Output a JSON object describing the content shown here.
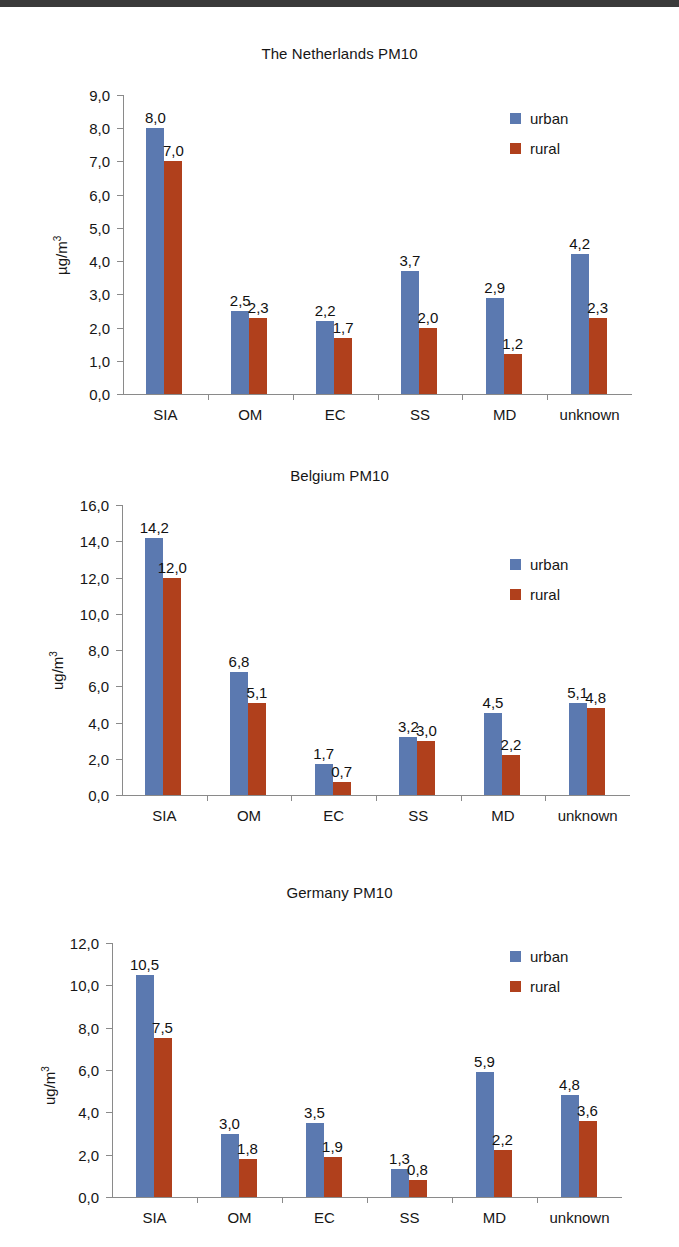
{
  "page": {
    "background": "#ffffff",
    "series_colors": {
      "urban": "#5b79b0",
      "rural": "#b0401c"
    },
    "axis_color": "#8a8a8a"
  },
  "legend": {
    "urban_label": "urban",
    "rural_label": "rural"
  },
  "chart_data": [
    {
      "id": "netherlands",
      "type": "bar",
      "title": "The Netherlands PM10",
      "xlabel": "",
      "ylabel": "µg/m3",
      "ylabel_base": "µg/m",
      "ylabel_sup": "3",
      "categories": [
        "SIA",
        "OM",
        "EC",
        "SS",
        "MD",
        "unknown"
      ],
      "ylim": [
        0,
        9
      ],
      "ytick_step": 1,
      "ytick_labels": [
        "0,0",
        "1,0",
        "2,0",
        "3,0",
        "4,0",
        "5,0",
        "6,0",
        "7,0",
        "8,0",
        "9,0"
      ],
      "grid": false,
      "legend_position": "top-right",
      "series": [
        {
          "name": "urban",
          "values": [
            8.0,
            2.5,
            2.2,
            3.7,
            2.9,
            4.2
          ],
          "labels": [
            "8,0",
            "2,5",
            "2,2",
            "3,7",
            "2,9",
            "4,2"
          ]
        },
        {
          "name": "rural",
          "values": [
            7.0,
            2.3,
            1.7,
            2.0,
            1.2,
            2.3
          ],
          "labels": [
            "7,0",
            "2,3",
            "1,7",
            "2,0",
            "1,2",
            "2,3"
          ]
        }
      ]
    },
    {
      "id": "belgium",
      "type": "bar",
      "title": "Belgium PM10",
      "xlabel": "",
      "ylabel": "ug/m3",
      "ylabel_base": "ug/m",
      "ylabel_sup": "3",
      "categories": [
        "SIA",
        "OM",
        "EC",
        "SS",
        "MD",
        "unknown"
      ],
      "ylim": [
        0,
        16
      ],
      "ytick_step": 2,
      "ytick_labels": [
        "0,0",
        "2,0",
        "4,0",
        "6,0",
        "8,0",
        "10,0",
        "12,0",
        "14,0",
        "16,0"
      ],
      "grid": false,
      "legend_position": "top-right",
      "series": [
        {
          "name": "urban",
          "values": [
            14.2,
            6.8,
            1.7,
            3.2,
            4.5,
            5.1
          ],
          "labels": [
            "14,2",
            "6,8",
            "1,7",
            "3,2",
            "4,5",
            "5,1"
          ]
        },
        {
          "name": "rural",
          "values": [
            12.0,
            5.1,
            0.7,
            3.0,
            2.2,
            4.8
          ],
          "labels": [
            "12,0",
            "5,1",
            "0,7",
            "3,0",
            "2,2",
            "4,8"
          ]
        }
      ]
    },
    {
      "id": "germany",
      "type": "bar",
      "title": "Germany  PM10",
      "xlabel": "",
      "ylabel": "ug/m3",
      "ylabel_base": "ug/m",
      "ylabel_sup": "3",
      "categories": [
        "SIA",
        "OM",
        "EC",
        "SS",
        "MD",
        "unknown"
      ],
      "ylim": [
        0,
        12
      ],
      "ytick_step": 2,
      "ytick_labels": [
        "0,0",
        "2,0",
        "4,0",
        "6,0",
        "8,0",
        "10,0",
        "12,0"
      ],
      "grid": false,
      "legend_position": "top-right",
      "series": [
        {
          "name": "urban",
          "values": [
            10.5,
            3.0,
            3.5,
            1.3,
            5.9,
            4.8
          ],
          "labels": [
            "10,5",
            "3,0",
            "3,5",
            "1,3",
            "5,9",
            "4,8"
          ]
        },
        {
          "name": "rural",
          "values": [
            7.5,
            1.8,
            1.9,
            0.8,
            2.2,
            3.6
          ],
          "labels": [
            "7,5",
            "1,8",
            "1,9",
            "0,8",
            "2,2",
            "3,6"
          ]
        }
      ]
    }
  ]
}
